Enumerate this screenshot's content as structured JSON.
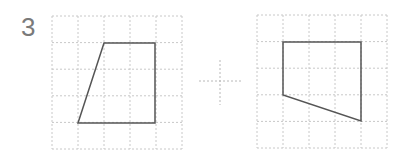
{
  "problem": {
    "number": "3",
    "operator": "plus",
    "colors": {
      "grid": "#c8c8c8",
      "shape": "#555555",
      "number": "#7a7a7a"
    }
  },
  "left_figure": {
    "grid": {
      "x": 52,
      "y": 16,
      "cols": 5,
      "rows": 5,
      "cell_w": 26,
      "cell_h": 26.6
    },
    "shape": "quadrilateral",
    "points": "104,43 155,43 155,123 78,123"
  },
  "right_figure": {
    "grid": {
      "x": 257,
      "y": 15,
      "cols": 5,
      "rows": 5,
      "cell_w": 26,
      "cell_h": 26.6
    },
    "shape": "quadrilateral",
    "points": "283,42 361,42 361,121 283,95"
  }
}
